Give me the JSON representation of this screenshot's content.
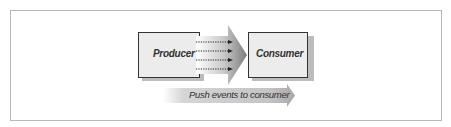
{
  "diagram": {
    "nodes": [
      {
        "id": "producer",
        "label": "Producer"
      },
      {
        "id": "consumer",
        "label": "Consumer"
      }
    ],
    "edges": [
      {
        "from": "producer",
        "to": "consumer",
        "style": "dotted",
        "count": 4
      }
    ],
    "caption_arrow": {
      "label": "Push events to consumer"
    }
  },
  "colors": {
    "frame": "#b8b8b8",
    "box_fill": "#ececec",
    "box_border": "#333333",
    "shadow": "#9a9a9a",
    "arrow": "#888888"
  }
}
